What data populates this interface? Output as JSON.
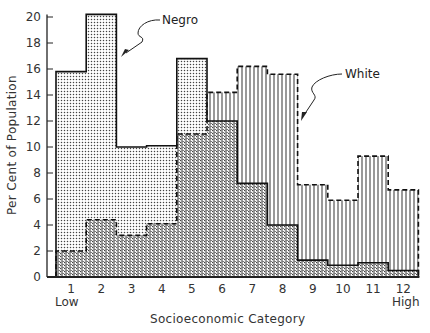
{
  "chart_data": {
    "type": "bar",
    "subtype": "overlapping-histogram",
    "title": "",
    "xlabel": "Socioeconomic Category",
    "ylabel": "Per Cent of Population",
    "categories": [
      "1",
      "2",
      "3",
      "4",
      "5",
      "6",
      "7",
      "8",
      "9",
      "10",
      "11",
      "12"
    ],
    "x_end_labels": {
      "low": "Low",
      "high": "High"
    },
    "yticks": [
      0,
      2,
      4,
      6,
      8,
      10,
      12,
      14,
      16,
      18,
      20
    ],
    "ylim": [
      0,
      20.5
    ],
    "grid": false,
    "series": [
      {
        "name": "Negro",
        "pattern": "dots",
        "outline": "solid",
        "values": [
          15.8,
          20.2,
          10.0,
          10.1,
          16.8,
          12.0,
          7.2,
          4.0,
          1.3,
          0.9,
          1.1,
          0.5
        ]
      },
      {
        "name": "White",
        "pattern": "vertical-lines",
        "outline": "dashed",
        "values": [
          2.0,
          4.4,
          3.2,
          4.1,
          11.0,
          14.2,
          16.2,
          15.6,
          7.1,
          5.9,
          9.3,
          6.7
        ]
      }
    ],
    "annotations": [
      {
        "text": "Negro",
        "points_to": "Negro series, category 2-3"
      },
      {
        "text": "White",
        "points_to": "White series, category 8"
      }
    ]
  },
  "labels": {
    "ylabel": "Per Cent of Population",
    "xlabel": "Socioeconomic Category",
    "low": "Low",
    "high": "High",
    "negro": "Negro",
    "white": "White"
  }
}
